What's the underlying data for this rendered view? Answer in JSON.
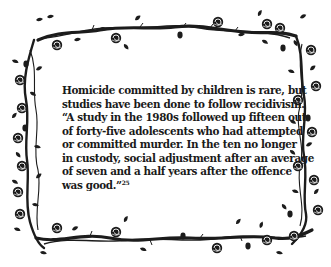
{
  "passage": {
    "lines": [
      "Homicide committed by children is rare, but",
      "studies have been done to follow recidivism.",
      "“A study in the 1980s followed up fifteen out",
      "of forty-five adolescents who had attempted",
      "or committed murder. In the ten no longer",
      "in custody, social adjustment after an average",
      "of seven and a half years after the offence",
      "was good.”"
    ],
    "footnote_marker": "25"
  },
  "border": {
    "style": "rose-vine-frame",
    "ink_color": "#1c1c1c",
    "background_color": "#ffffff"
  }
}
